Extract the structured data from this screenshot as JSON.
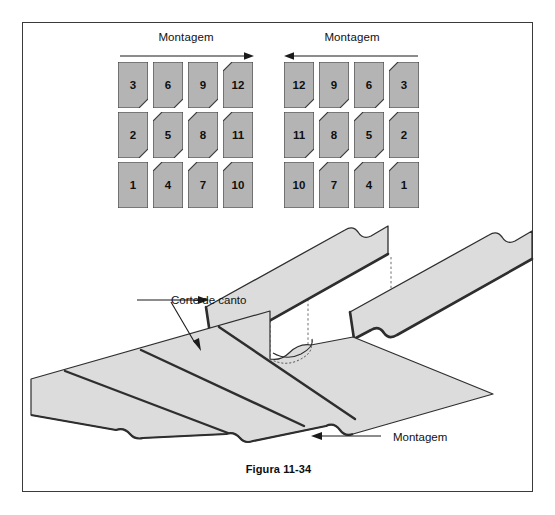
{
  "figure": {
    "caption": "Figura 11-34",
    "direction_label_left": "Montagem",
    "direction_label_right": "Montagem",
    "corner_cut_label": "Corte de canto",
    "assembly_label": "Montagem"
  },
  "colors": {
    "tile_fill": "#b4b4b4",
    "tile_stroke": "#3c3c3c",
    "panel_fill": "#dcdcdc",
    "panel_edge": "#2e2e2e",
    "frame": "#3a3a3a",
    "text": "#111111"
  },
  "grids": {
    "left": {
      "arrow_direction": "right",
      "rows": [
        [
          {
            "number": "3",
            "cut": "bottom-right"
          },
          {
            "number": "6",
            "cut": "bottom-right"
          },
          {
            "number": "9",
            "cut": "bottom-right"
          },
          {
            "number": "12",
            "cut": "top-left"
          }
        ],
        [
          {
            "number": "2",
            "cut": "bottom-right"
          },
          {
            "number": "5",
            "cut": "both"
          },
          {
            "number": "8",
            "cut": "both"
          },
          {
            "number": "11",
            "cut": "top-left"
          }
        ],
        [
          {
            "number": "1",
            "cut": "none"
          },
          {
            "number": "4",
            "cut": "top-left"
          },
          {
            "number": "7",
            "cut": "top-left"
          },
          {
            "number": "10",
            "cut": "top-left"
          }
        ]
      ]
    },
    "right": {
      "arrow_direction": "left",
      "rows": [
        [
          {
            "number": "12",
            "cut": "bottom-right"
          },
          {
            "number": "9",
            "cut": "bottom-right"
          },
          {
            "number": "6",
            "cut": "bottom-right"
          },
          {
            "number": "3",
            "cut": "top-left"
          }
        ],
        [
          {
            "number": "11",
            "cut": "bottom-right"
          },
          {
            "number": "8",
            "cut": "both"
          },
          {
            "number": "5",
            "cut": "both"
          },
          {
            "number": "2",
            "cut": "top-left"
          }
        ],
        [
          {
            "number": "10",
            "cut": "none"
          },
          {
            "number": "7",
            "cut": "top-left"
          },
          {
            "number": "4",
            "cut": "top-left"
          },
          {
            "number": "1",
            "cut": "top-left"
          }
        ]
      ]
    }
  }
}
